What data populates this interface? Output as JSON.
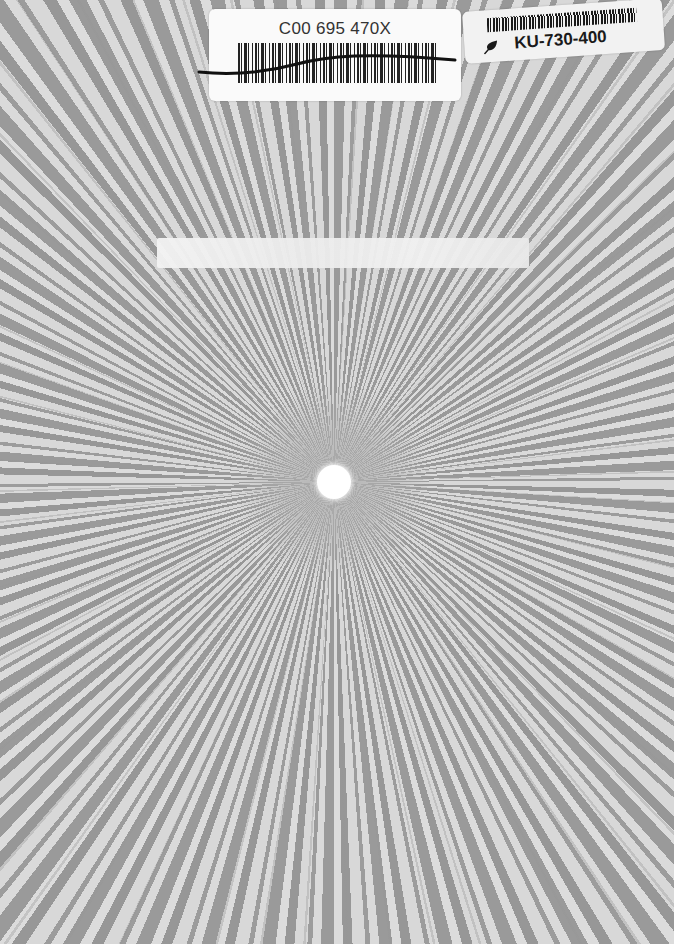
{
  "cover": {
    "pattern": "grey radial sunburst rays",
    "colors": {
      "ray_dark": "#9a9a9a",
      "ray_light": "#dadada",
      "center_hole": "#ffffff"
    },
    "center_hole": {
      "shape": "circle"
    }
  },
  "stickers": {
    "main_barcode": {
      "code": "C00 695 470X",
      "note": "barcode crossed through with marker line"
    },
    "side_barcode": {
      "code": "KU-730-400",
      "icon": "leaf-icon"
    }
  },
  "worn_strip": {
    "text": ""
  }
}
